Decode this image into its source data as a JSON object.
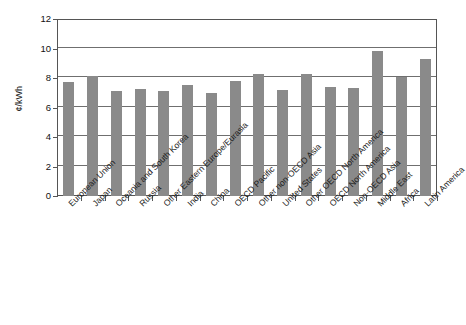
{
  "chart_data": {
    "type": "bar",
    "title": "",
    "xlabel": "",
    "ylabel": "¢/kWh",
    "ylim": [
      0,
      12
    ],
    "yticks": [
      0,
      2,
      4,
      6,
      8,
      10,
      12
    ],
    "grid": true,
    "legend": "none",
    "bar_color": "#8a8a8a",
    "categories": [
      "European Union",
      "Japan",
      "Oceania and South Korea",
      "Russia",
      "Other Eastern Europe/Eurasia",
      "India",
      "China",
      "OECD Pacific",
      "Other non-OECD Asia",
      "United States",
      "Other OECD North America",
      "OECD North America",
      "Non-OECD Asia",
      "Middle East",
      "Africa",
      "Latin America"
    ],
    "values": [
      7.75,
      8.15,
      7.15,
      7.25,
      7.15,
      7.5,
      7.0,
      7.8,
      8.3,
      7.2,
      8.3,
      7.4,
      7.35,
      9.8,
      8.05,
      9.3
    ]
  },
  "axis": {
    "y_title": "¢/kWh",
    "y_tick_labels": [
      "12",
      "10",
      "8",
      "6",
      "4",
      "2",
      "0"
    ]
  }
}
